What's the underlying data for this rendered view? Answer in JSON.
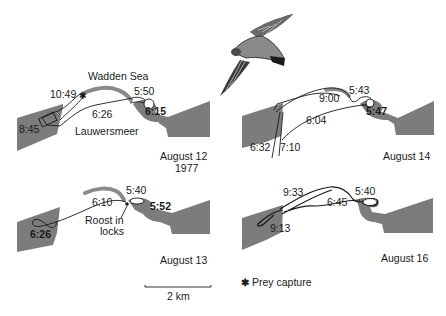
{
  "colors": {
    "land": "#7c7c7c",
    "track": "#1a1a1a",
    "dike": "#8a8a8a",
    "background": "#ffffff"
  },
  "labels": {
    "sea": "Wadden Sea",
    "lake": "Lauwersmeer",
    "roost": "Roost in",
    "roost2": "locks"
  },
  "panels": [
    {
      "id": "aug12",
      "date": "August 12",
      "year": "1977",
      "times": [
        "10:49",
        "5:50",
        "6:26",
        "6:15",
        "8:45"
      ],
      "prey_capture_at": "10:49"
    },
    {
      "id": "aug14",
      "date": "August 14",
      "times": [
        "5:43",
        "9:00",
        "5:47",
        "6:04",
        "6:32",
        "7:10"
      ]
    },
    {
      "id": "aug13",
      "date": "August 13",
      "times": [
        "5:40",
        "6:10",
        "5:52",
        "6:26"
      ]
    },
    {
      "id": "aug16",
      "date": "August 16",
      "times": [
        "9:33",
        "5:40",
        "6:45",
        "9:13"
      ]
    }
  ],
  "legend": {
    "scale_label": "2 km",
    "prey_symbol": "✱",
    "prey_label": "Prey capture"
  },
  "illustration": {
    "subject": "falcon-in-flight"
  }
}
